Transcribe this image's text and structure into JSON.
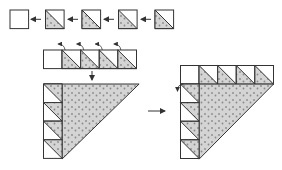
{
  "diagram": {
    "colors": {
      "outline": "#333333",
      "fabric_fill": "#d4d4d4",
      "dot": "#8a8a8a",
      "background": "#ffffff",
      "arrow": "#333333"
    },
    "steps": [
      {
        "id": "step-1",
        "description": "Row of single units: one plain square and four half-square triangle units, joined right to left",
        "units": [
          "plain-square",
          "half-square-triangle",
          "half-square-triangle",
          "half-square-triangle",
          "half-square-triangle"
        ],
        "arrow_direction": "left"
      },
      {
        "id": "step-2",
        "description": "Joined strip of five units with press arrows pointing left",
        "units": [
          "plain-square",
          "half-square-triangle",
          "half-square-triangle",
          "half-square-triangle",
          "half-square-triangle"
        ],
        "press_arrows": 4,
        "arrow_direction": "down"
      },
      {
        "id": "step-3",
        "description": "Large dotted triangle with vertical column of four units along left side",
        "column_units": 4
      },
      {
        "id": "step-4",
        "description": "Large dotted triangle with horizontal strip across top and vertical column on left",
        "top_units": 5,
        "column_units": 4,
        "arrow_direction": "right"
      }
    ]
  }
}
